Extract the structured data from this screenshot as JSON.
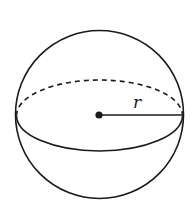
{
  "diagram": {
    "type": "sphere",
    "labels": {
      "radius": "r"
    },
    "colors": {
      "stroke": "#1a1a1a",
      "background": "#ffffff"
    },
    "geometry": {
      "center": [
        99.5,
        115
      ],
      "outline_radius": 84,
      "equator_rx": 83,
      "equator_ry": 35.5,
      "center_dot_radius": 3.5,
      "radius_line_end": [
        182,
        115
      ]
    },
    "elements": [
      {
        "name": "sphere-outline",
        "style": "solid"
      },
      {
        "name": "equator-back-arc",
        "style": "dashed"
      },
      {
        "name": "equator-front-arc",
        "style": "solid"
      },
      {
        "name": "center-point",
        "style": "filled"
      },
      {
        "name": "radius-line",
        "style": "solid"
      },
      {
        "name": "radius-label",
        "text": "r"
      }
    ]
  }
}
